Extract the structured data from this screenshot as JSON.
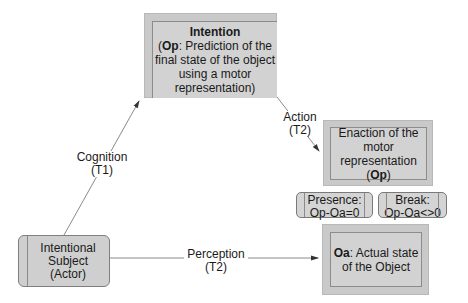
{
  "nodes": {
    "intention": {
      "title": "Intention",
      "op_bold": "Op",
      "line1_rest": ": Prediction of the",
      "line2": "final state of the object",
      "line3": "using a motor",
      "line4": "representation)"
    },
    "enaction": {
      "line1": "Enaction of the",
      "line2": "motor",
      "line3": "representation",
      "op_bold": "Op"
    },
    "presence": {
      "line1": "Presence:",
      "line2": "Op-Oa=0"
    },
    "break": {
      "line1": "Break:",
      "line2": "Op-Oa<>0"
    },
    "actual_state": {
      "oa_bold": "Oa",
      "line1_rest": ": Actual state",
      "line2": "of the Object"
    },
    "actor": {
      "line1": "Intentional",
      "line2": "Subject",
      "line3": "(Actor)"
    }
  },
  "edges": {
    "cognition": {
      "label": "Cognition",
      "time": "(T1)"
    },
    "action": {
      "label": "Action",
      "time": "(T2)"
    },
    "perception": {
      "label": "Perception",
      "time": "(T2)"
    }
  }
}
